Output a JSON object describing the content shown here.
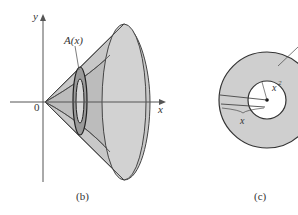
{
  "figure_b": {
    "caption": "(b)",
    "axis_y_label": "y",
    "axis_x_label": "x",
    "origin_label": "0",
    "cross_section_label": "A(x)"
  },
  "figure_c": {
    "caption": "(c)",
    "inner_radius_label": "x",
    "inner_radius_exp": "2",
    "outer_radius_label": "x"
  },
  "colors": {
    "solid_fill": "#c8c8c8",
    "solid_shade": "#b0b0b0",
    "outline": "#444444",
    "washer_fill": "#cfcfcf"
  }
}
